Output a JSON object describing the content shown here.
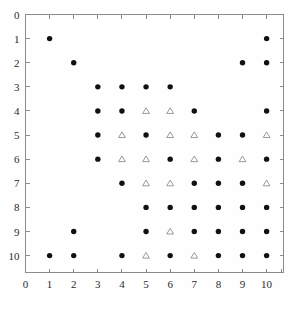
{
  "chart_data": {
    "type": "scatter",
    "title": "",
    "subtitle": "",
    "xlabel": "",
    "ylabel": "",
    "xlim": [
      0,
      10.7
    ],
    "ylim": [
      0,
      10.7
    ],
    "y_axis_inverted": true,
    "grid": false,
    "legend": null,
    "legend_position": "none",
    "x_ticks": [
      0,
      1,
      2,
      3,
      4,
      5,
      6,
      7,
      8,
      9,
      10
    ],
    "y_ticks": [
      0,
      1,
      2,
      3,
      4,
      5,
      6,
      7,
      8,
      9,
      10
    ],
    "x_tick_labels": [
      "0",
      "1",
      "2",
      "3",
      "4",
      "5",
      "6",
      "7",
      "8",
      "9",
      "10"
    ],
    "y_tick_labels": [
      "0",
      "1",
      "2",
      "3",
      "4",
      "5",
      "6",
      "7",
      "8",
      "9",
      "10"
    ],
    "series": [
      {
        "name": "filled-circle",
        "marker": "circle",
        "filled": true,
        "color": "#111111",
        "points": [
          [
            1,
            1
          ],
          [
            10,
            1
          ],
          [
            2,
            2
          ],
          [
            9,
            2
          ],
          [
            10,
            2
          ],
          [
            3,
            3
          ],
          [
            4,
            3
          ],
          [
            5,
            3
          ],
          [
            6,
            3
          ],
          [
            3,
            4
          ],
          [
            4,
            4
          ],
          [
            7,
            4
          ],
          [
            10,
            4
          ],
          [
            3,
            5
          ],
          [
            5,
            5
          ],
          [
            8,
            5
          ],
          [
            9,
            5
          ],
          [
            3,
            6
          ],
          [
            6,
            6
          ],
          [
            8,
            6
          ],
          [
            10,
            6
          ],
          [
            4,
            7
          ],
          [
            7,
            7
          ],
          [
            8,
            7
          ],
          [
            9,
            7
          ],
          [
            5,
            8
          ],
          [
            6,
            8
          ],
          [
            7,
            8
          ],
          [
            8,
            8
          ],
          [
            9,
            8
          ],
          [
            10,
            8
          ],
          [
            2,
            9
          ],
          [
            5,
            9
          ],
          [
            7,
            9
          ],
          [
            8,
            9
          ],
          [
            9,
            9
          ],
          [
            10,
            9
          ],
          [
            1,
            10
          ],
          [
            2,
            10
          ],
          [
            4,
            10
          ],
          [
            6,
            10
          ],
          [
            8,
            10
          ],
          [
            9,
            10
          ],
          [
            10,
            10
          ]
        ]
      },
      {
        "name": "open-triangle",
        "marker": "triangle",
        "filled": false,
        "color": "#8e8e8e",
        "points": [
          [
            5,
            4
          ],
          [
            6,
            4
          ],
          [
            4,
            5
          ],
          [
            6,
            5
          ],
          [
            7,
            5
          ],
          [
            10,
            5
          ],
          [
            4,
            6
          ],
          [
            5,
            6
          ],
          [
            7,
            6
          ],
          [
            9,
            6
          ],
          [
            5,
            7
          ],
          [
            6,
            7
          ],
          [
            10,
            7
          ],
          [
            6,
            9
          ],
          [
            5,
            10
          ],
          [
            7,
            10
          ]
        ]
      }
    ]
  }
}
